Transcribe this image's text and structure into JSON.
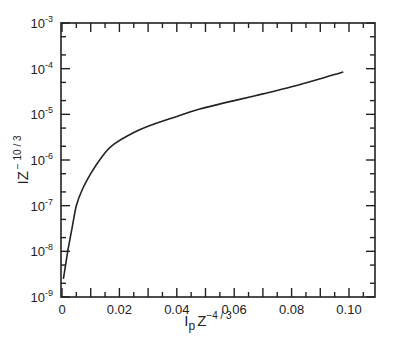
{
  "chart_data": {
    "type": "line",
    "title": "",
    "xlabel": "I_p Z^-4/3",
    "xlabel_main": "I",
    "xlabel_sub": "p",
    "xlabel_z": "Z",
    "xlabel_sup": "−4 / 3",
    "ylabel": "IZ^-10/3",
    "ylabel_main": "IZ",
    "ylabel_sup": "− 10 / 3",
    "xlim": [
      0,
      0.109
    ],
    "ylim": [
      1e-09,
      0.001
    ],
    "yscale": "log",
    "grid": false,
    "legend": null,
    "x_ticks": [
      {
        "value": 0,
        "label": "0"
      },
      {
        "value": 0.02,
        "label": "0.02"
      },
      {
        "value": 0.04,
        "label": "0.04"
      },
      {
        "value": 0.06,
        "label": "0.06"
      },
      {
        "value": 0.08,
        "label": "0.08"
      },
      {
        "value": 0.1,
        "label": "0.10"
      }
    ],
    "y_ticks": [
      {
        "value": 0.001,
        "base": "10",
        "exp": "-3"
      },
      {
        "value": 0.0001,
        "base": "10",
        "exp": "-4"
      },
      {
        "value": 1e-05,
        "base": "10",
        "exp": "-5"
      },
      {
        "value": 1e-06,
        "base": "10",
        "exp": "-6"
      },
      {
        "value": 1e-07,
        "base": "10",
        "exp": "-7"
      },
      {
        "value": 1e-08,
        "base": "10",
        "exp": "-8"
      },
      {
        "value": 1e-09,
        "base": "10",
        "exp": "-9"
      }
    ],
    "series": [
      {
        "name": "IZ^-10/3 vs I_p Z^-4/3",
        "color": "#222222",
        "x": [
          0.0005,
          0.002,
          0.0035,
          0.005,
          0.007,
          0.01,
          0.014,
          0.018,
          0.025,
          0.03,
          0.04,
          0.048,
          0.06,
          0.07,
          0.08,
          0.09,
          0.098
        ],
        "y": [
          2.5e-09,
          1e-08,
          3.2e-08,
          1e-07,
          2.2e-07,
          5e-07,
          1.2e-06,
          2.2e-06,
          4e-06,
          5.5e-06,
          9e-06,
          1.3e-05,
          2e-05,
          2.8e-05,
          4e-05,
          6e-05,
          8.5e-05
        ]
      }
    ]
  }
}
